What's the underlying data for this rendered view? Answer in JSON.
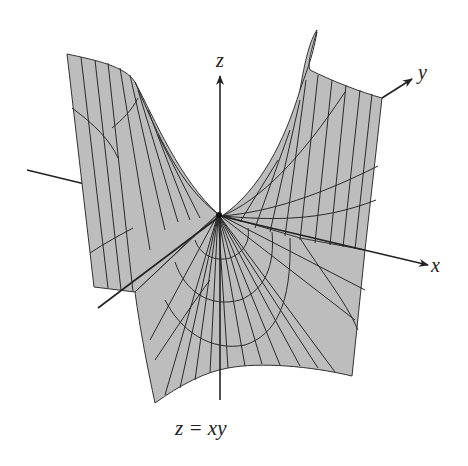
{
  "figure": {
    "equation_label": "z = xy",
    "surface_fill": "#bdbdbd",
    "line_color": "#2a2a2a",
    "background": "#ffffff"
  },
  "axes": {
    "x": {
      "label": "x"
    },
    "y": {
      "label": "y"
    },
    "z": {
      "label": "z"
    }
  }
}
